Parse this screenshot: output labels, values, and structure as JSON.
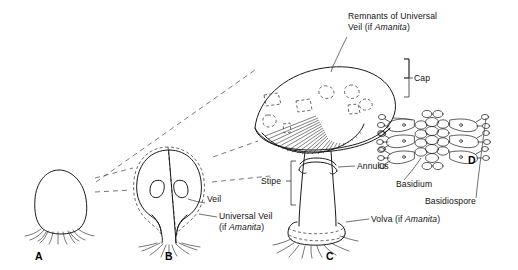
{
  "figure": {
    "background": "#ffffff",
    "ink": "#1a1a1a",
    "dash_color": "#555555"
  },
  "labels": {
    "remnants_line1": "Remnants of Universal",
    "remnants_line2_pre": "Veil (if ",
    "remnants_line2_it": "Amanita",
    "remnants_line2_post": ")",
    "cap": "Cap",
    "annulus": "Annulus",
    "stipe": "Stipe",
    "veil": "Veil",
    "universal_veil": "Universal  Veil",
    "universal_veil_cond_pre": "(if ",
    "universal_veil_cond_it": "Amanita",
    "universal_veil_cond_post": ")",
    "volva_pre": "Volva (if ",
    "volva_it": "Amanita",
    "volva_post": ")",
    "basidium": "Basidium",
    "basidiospore": "Basidiospore"
  },
  "stages": [
    {
      "id": "A",
      "letter": "A",
      "caption": "button stage enclosed in universal veil"
    },
    {
      "id": "B",
      "letter": "B",
      "caption": "expanding button with partial veil"
    },
    {
      "id": "C",
      "letter": "C",
      "caption": "mature fruiting body"
    },
    {
      "id": "D",
      "letter": "D",
      "caption": "gill section with basidia and basidiospores"
    }
  ]
}
